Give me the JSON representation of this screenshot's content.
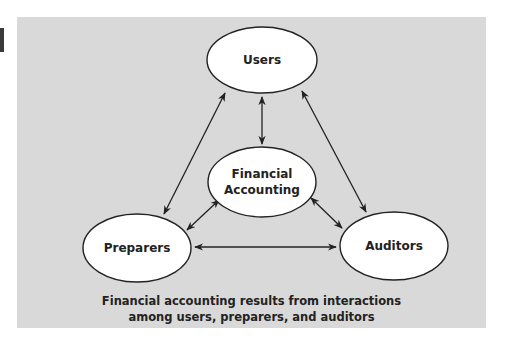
{
  "diagram": {
    "colors": {
      "panel_bg": "#d9d9d9",
      "node_fill": "#ffffff",
      "node_stroke": "#222222",
      "arrow": "#222222",
      "text": "#222222"
    },
    "nodes": [
      {
        "id": "users",
        "label": "Users"
      },
      {
        "id": "financial-accounting",
        "label_lines": [
          "Financial",
          "Accounting"
        ]
      },
      {
        "id": "preparers",
        "label": "Preparers"
      },
      {
        "id": "auditors",
        "label": "Auditors"
      }
    ],
    "edges": [
      {
        "from": "users",
        "to": "financial-accounting",
        "type": "bidirectional"
      },
      {
        "from": "users",
        "to": "preparers",
        "type": "bidirectional"
      },
      {
        "from": "users",
        "to": "auditors",
        "type": "bidirectional"
      },
      {
        "from": "financial-accounting",
        "to": "preparers",
        "type": "bidirectional"
      },
      {
        "from": "financial-accounting",
        "to": "auditors",
        "type": "bidirectional"
      },
      {
        "from": "preparers",
        "to": "auditors",
        "type": "bidirectional"
      }
    ],
    "caption": {
      "line1": "Financial accounting results from interactions",
      "line2": "among users, preparers, and auditors"
    }
  }
}
